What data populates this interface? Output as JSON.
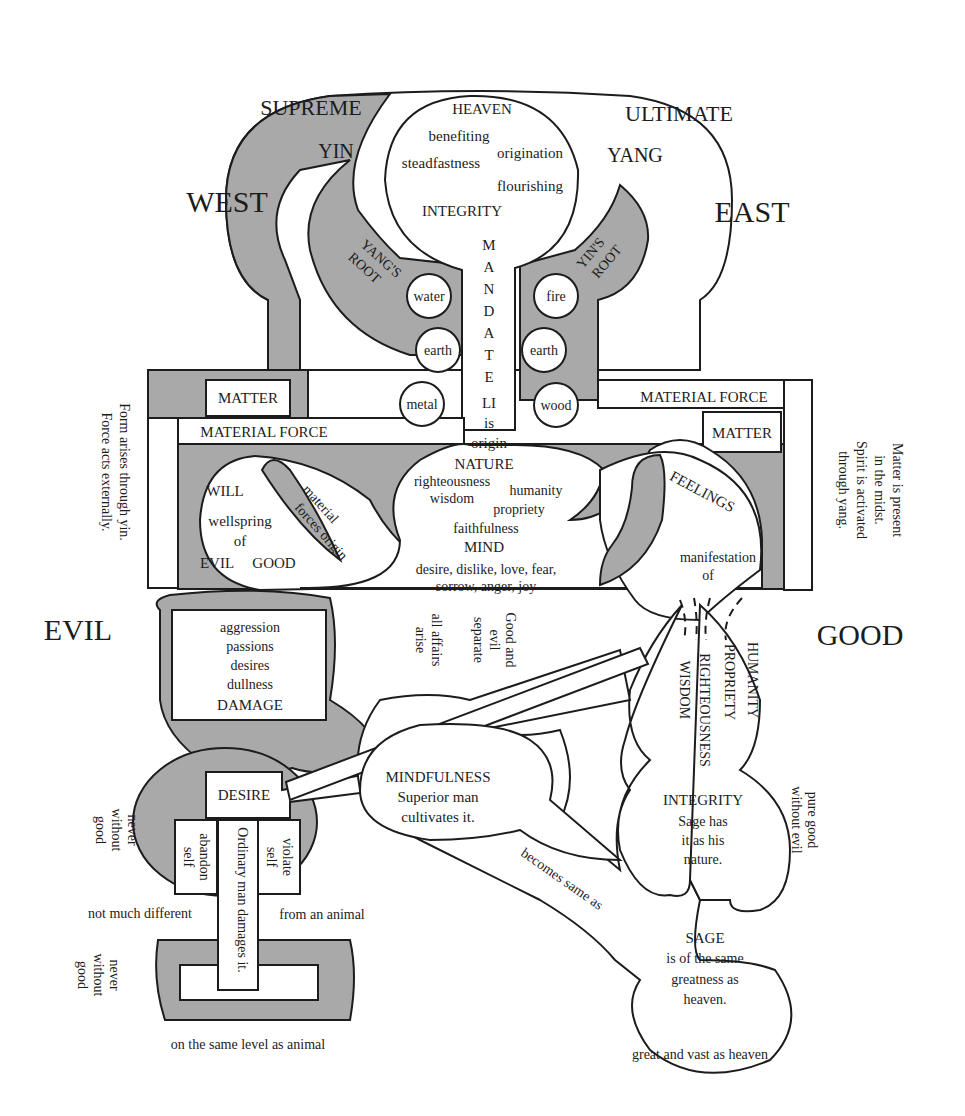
{
  "colors": {
    "shade": "#a9a9a9",
    "ink": "#1c1c1c",
    "background": "#ffffff"
  },
  "corners": {
    "top_left": "SUPREME",
    "top_right": "ULTIMATE"
  },
  "directions": {
    "west": "WEST",
    "east": "EAST",
    "evil": "EVIL",
    "good": "GOOD"
  },
  "heaven": {
    "title": "HEAVEN",
    "virtues": [
      "benefiting",
      "origination",
      "steadfastness",
      "flourishing"
    ],
    "integrity": "INTEGRITY",
    "yin": "YIN",
    "yang": "YANG"
  },
  "roots": {
    "left": [
      "YANG'S",
      "ROOT"
    ],
    "right": [
      "YIN'S",
      "ROOT"
    ]
  },
  "mandate": {
    "letters": [
      "M",
      "A",
      "N",
      "D",
      "A",
      "T",
      "E"
    ],
    "li": "LI",
    "is": "is",
    "origin": "origin"
  },
  "elements": {
    "left": [
      "water",
      "earth",
      "metal"
    ],
    "right": [
      "fire",
      "earth",
      "wood"
    ]
  },
  "matter": {
    "left_box": "MATTER",
    "left_force": "MATERIAL FORCE",
    "right_force": "MATERIAL FORCE",
    "right_box": "MATTER"
  },
  "side_notes": {
    "left": [
      "Form arises through yin.",
      "Force acts externally."
    ],
    "right": [
      "Matter is present",
      "in the midst.",
      "Spirit is activated",
      "through yang."
    ]
  },
  "will": {
    "title": "WILL",
    "lines": [
      "wellspring",
      "of"
    ],
    "evil": "EVIL",
    "good": "GOOD",
    "material_forces": [
      "material",
      "forces origin"
    ]
  },
  "nature": {
    "title": "NATURE",
    "virtues": [
      "righteousness",
      "humanity",
      "wisdom",
      "propriety",
      "faithfulness"
    ],
    "mind": "MIND",
    "emotions": [
      "desire, dislike, love, fear,",
      "sorrow, anger, joy"
    ]
  },
  "feelings": {
    "title": "FEELINGS",
    "lines": [
      "manifestation",
      "of"
    ]
  },
  "separation_notes": {
    "affairs": [
      "all affairs",
      "arise"
    ],
    "good_evil": [
      "Good and",
      "evil",
      "separate"
    ]
  },
  "damage_box": {
    "lines": [
      "aggression",
      "passions",
      "desires",
      "dullness"
    ],
    "title": "DAMAGE"
  },
  "four_virtues": [
    "WISDOM",
    "RIGHTEOUSNESS",
    "PROPRIETY",
    "HUMANITY"
  ],
  "desire": {
    "title": "DESIRE",
    "abandon": [
      "abandon",
      "self"
    ],
    "violate": [
      "violate",
      "self"
    ],
    "ordinary": "Ordinary man damages it."
  },
  "never_without_good": [
    "never",
    "without",
    "good"
  ],
  "animal": {
    "not_much": "not much different",
    "from_animal": "from an animal",
    "same_level": "on the same level as animal"
  },
  "mindfulness": {
    "title": "MINDFULNESS",
    "lines": [
      "Superior man",
      "cultivates it."
    ]
  },
  "becomes": "becomes same as",
  "integrity_sage": {
    "title": "INTEGRITY",
    "lines": [
      "Sage has",
      "it as his",
      "nature."
    ]
  },
  "pure_good": [
    "pure good",
    "without evil"
  ],
  "sage": {
    "title": "SAGE",
    "lines": [
      "is of the same",
      "greatness as",
      "heaven."
    ]
  },
  "great_vast": "great and vast as heaven"
}
